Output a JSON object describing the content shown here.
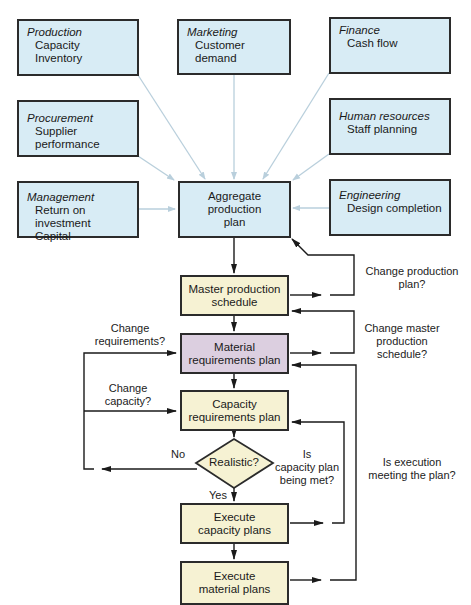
{
  "departments": [
    {
      "id": "production",
      "title": "Production",
      "items": [
        "Capacity",
        "Inventory"
      ]
    },
    {
      "id": "marketing",
      "title": "Marketing",
      "items": [
        "Customer demand"
      ]
    },
    {
      "id": "finance",
      "title": "Finance",
      "items": [
        "Cash flow"
      ]
    },
    {
      "id": "procurement",
      "title": "Procurement",
      "items": [
        "Supplier performance"
      ]
    },
    {
      "id": "human-resources",
      "title": "Human resources",
      "items": [
        "Staff planning"
      ]
    },
    {
      "id": "management",
      "title": "Management",
      "items": [
        "Return on investment",
        "Capital"
      ]
    },
    {
      "id": "engineering",
      "title": "Engineering",
      "items": [
        "Design completion"
      ]
    }
  ],
  "flow": {
    "aggregate_plan": "Aggregate\nproduction\nplan",
    "master_schedule": "Master production\nschedule",
    "mrp": "Material\nrequirements plan",
    "crp": "Capacity\nrequirements plan",
    "decision": "Realistic?",
    "execute_capacity": "Execute\ncapacity plans",
    "execute_material": "Execute\nmaterial plans"
  },
  "labels": {
    "change_production_plan": "Change production\nplan?",
    "change_master_schedule": "Change master\nproduction\nschedule?",
    "change_requirements": "Change\nrequirements?",
    "change_capacity": "Change\ncapacity?",
    "no": "No",
    "yes": "Yes",
    "capacity_plan_met": "Is\ncapacity plan\nbeing met?",
    "execution_meeting_plan": "Is execution\nmeeting the plan?"
  },
  "colors": {
    "department_fill": "#d8ecf5",
    "flow_fill": "#f6f2d3",
    "mrp_fill": "#dccfe0",
    "input_arrow": "#b9cfdc",
    "flow_arrow": "#1a1a1a"
  }
}
